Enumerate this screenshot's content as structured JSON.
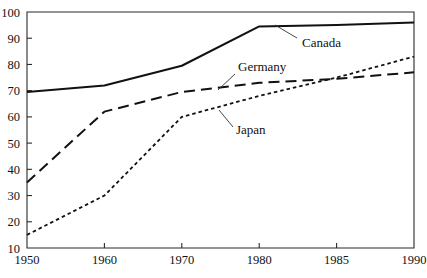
{
  "chart_data": {
    "type": "line",
    "title": "",
    "subtitle": "",
    "xlabel": "",
    "ylabel": "",
    "categories": [
      "1950",
      "1960",
      "1970",
      "1980",
      "1985",
      "1990"
    ],
    "xtick_labels": [
      "1950",
      "1960",
      "1970",
      "1980",
      "1985",
      "1990"
    ],
    "ytick_labels": [
      "10",
      "20",
      "30",
      "40",
      "50",
      "60",
      "70",
      "80",
      "90",
      "100"
    ],
    "ylim": [
      10,
      100
    ],
    "ytick_step": 10,
    "grid": false,
    "legend_position": "inline-annotations",
    "series": [
      {
        "name": "Canada",
        "line_style": "solid",
        "color": "#111111",
        "line_width": 2.0,
        "values": [
          69.5,
          72,
          79.5,
          94.5,
          95,
          96
        ]
      },
      {
        "name": "Germany",
        "line_style": "long-dash",
        "color": "#111111",
        "line_width": 2.0,
        "values": [
          35,
          62,
          69.5,
          73,
          74.5,
          77
        ]
      },
      {
        "name": "Japan",
        "line_style": "short-dash",
        "color": "#111111",
        "line_width": 1.8,
        "values": [
          15,
          30,
          60,
          68,
          75,
          83
        ]
      }
    ],
    "annotations": [
      {
        "text": "Canada",
        "label_x": 302,
        "label_y": 47,
        "leader_from_x": 297,
        "leader_from_y": 38,
        "leader_to_x": 275,
        "leader_to_y": 25
      },
      {
        "text": "Germany",
        "label_x": 238,
        "label_y": 71,
        "leader_from_x": 235,
        "leader_from_y": 74,
        "leader_to_x": 218,
        "leader_to_y": 90
      },
      {
        "text": "Japan",
        "label_x": 236,
        "label_y": 134,
        "leader_from_x": 233,
        "leader_from_y": 127,
        "leader_to_x": 219,
        "leader_to_y": 110
      }
    ]
  },
  "axes": {
    "plot_left": 27,
    "plot_right": 414,
    "plot_top": 12,
    "plot_bottom": 248
  }
}
